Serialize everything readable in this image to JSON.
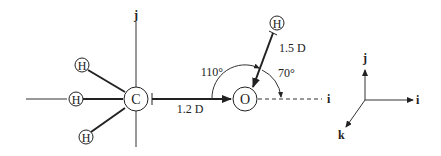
{
  "diagram": {
    "colors": {
      "ink": "#222222",
      "background": "#ffffff"
    },
    "atoms": {
      "carbon": {
        "label": "C"
      },
      "oxygen": {
        "label": "O"
      },
      "h_upper_left": {
        "label": "H"
      },
      "h_left": {
        "label": "H"
      },
      "h_lower_left": {
        "label": "H"
      },
      "h_hydroxyl": {
        "label": "H"
      }
    },
    "axes_local": {
      "j_label": "j",
      "i_label": "i"
    },
    "vectors": {
      "c_to_o": {
        "magnitude_label": "1.2 D"
      },
      "h_to_o": {
        "magnitude_label": "1.5 D"
      }
    },
    "angles": {
      "large": {
        "label": "110°"
      },
      "small": {
        "label": "70°"
      }
    },
    "reference_frame": {
      "i_label": "i",
      "j_label": "j",
      "k_label": "k"
    }
  }
}
